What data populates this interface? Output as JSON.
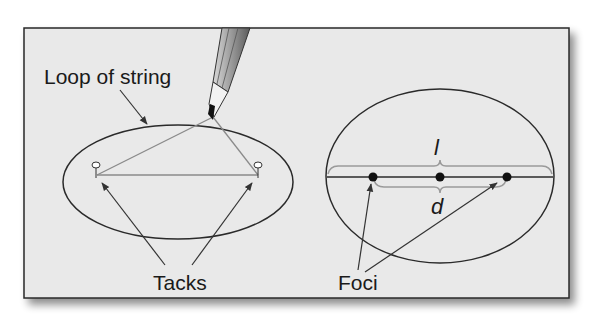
{
  "figure": {
    "panel_background": "#e9e9e9",
    "border_color": "#2a2a2a",
    "left_panel": {
      "labels": {
        "loop_of_string": "Loop of string",
        "tacks": "Tacks"
      }
    },
    "right_panel": {
      "labels": {
        "major_axis_length": "l",
        "focal_distance": "d",
        "foci": "Foci"
      }
    }
  }
}
